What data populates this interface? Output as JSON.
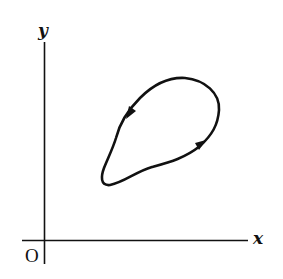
{
  "figure": {
    "axes": {
      "x_label": "x",
      "y_label": "y",
      "origin_label": "O"
    },
    "curve": {
      "type": "closed-loop",
      "orientation": "counter-clockwise",
      "arrow_count": 2
    },
    "colors": {
      "ink": "#111111",
      "background": "#ffffff"
    }
  }
}
